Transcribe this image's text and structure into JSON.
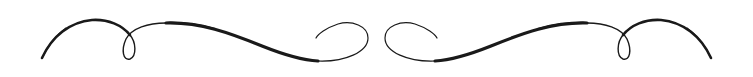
{
  "ornament": {
    "type": "calligraphic-flourish-divider",
    "stroke_color": "#1a1a1a",
    "background": "#ffffff",
    "symmetry": "mirrored-horizontal",
    "center_x": 376.5
  }
}
